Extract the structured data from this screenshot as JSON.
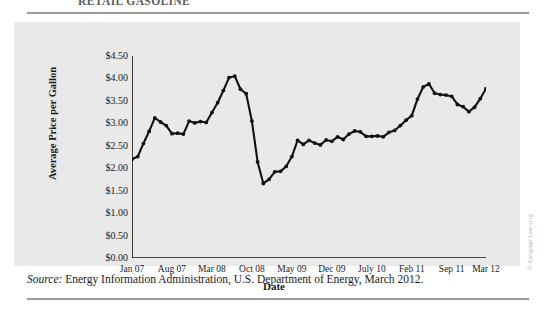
{
  "figure": {
    "running_head": "RETAIL GASOLINE",
    "credit": "© Cengage Learning"
  },
  "source": {
    "prefix": "Source:",
    "text": " Energy Information Administration, U.S. Department of Energy, March 2012."
  },
  "axes": {
    "ylabel": "Average Price per Gallon",
    "xlabel": "Date",
    "ytick_labels": [
      "$4.50",
      "$4.00",
      "$3.50",
      "$3.00",
      "$2.50",
      "$2.00",
      "$1.50",
      "$1.00",
      "$0.50",
      "$0.00"
    ],
    "xtick_labels": [
      "Jan 07",
      "Aug 07",
      "Mar 08",
      "Oct 08",
      "May 09",
      "Dec 09",
      "July 10",
      "Feb 11",
      "Sep 11",
      "Mar 12"
    ]
  },
  "chart_data": {
    "type": "line",
    "xlabel": "Date",
    "ylabel": "Average Price per Gallon",
    "ylim": [
      0.0,
      4.5
    ],
    "ytick_values": [
      0.0,
      0.5,
      1.0,
      1.5,
      2.0,
      2.5,
      3.0,
      3.5,
      4.0,
      4.5
    ],
    "ytick_labels": [
      "$0.00",
      "$0.50",
      "$1.00",
      "$1.50",
      "$2.00",
      "$2.50",
      "$3.00",
      "$3.50",
      "$4.00",
      "$4.50"
    ],
    "grid": false,
    "legend": "none",
    "markers": "filled-circle",
    "line_color": "#111111",
    "panel_color": "#e9e9e9",
    "xtick_labels": [
      "Jan 07",
      "Aug 07",
      "Mar 08",
      "Oct 08",
      "May 09",
      "Dec 09",
      "July 10",
      "Feb 11",
      "Sep 11",
      "Mar 12"
    ],
    "xtick_indices": [
      0,
      7,
      14,
      21,
      28,
      35,
      42,
      49,
      56,
      62
    ],
    "x": [
      "Jan 07",
      "Feb 07",
      "Mar 07",
      "Apr 07",
      "May 07",
      "Jun 07",
      "Jul 07",
      "Aug 07",
      "Sep 07",
      "Oct 07",
      "Nov 07",
      "Dec 07",
      "Jan 08",
      "Feb 08",
      "Mar 08",
      "Apr 08",
      "May 08",
      "Jun 08",
      "Jul 08",
      "Aug 08",
      "Sep 08",
      "Oct 08",
      "Nov 08",
      "Dec 08",
      "Jan 09",
      "Feb 09",
      "Mar 09",
      "Apr 09",
      "May 09",
      "Jun 09",
      "Jul 09",
      "Aug 09",
      "Sep 09",
      "Oct 09",
      "Nov 09",
      "Dec 09",
      "Jan 10",
      "Feb 10",
      "Mar 10",
      "Apr 10",
      "May 10",
      "Jun 10",
      "Jul 10",
      "Aug 10",
      "Sep 10",
      "Oct 10",
      "Nov 10",
      "Dec 10",
      "Jan 11",
      "Feb 11",
      "Mar 11",
      "Apr 11",
      "May 11",
      "Jun 11",
      "Jul 11",
      "Aug 11",
      "Sep 11",
      "Oct 11",
      "Nov 11",
      "Dec 11",
      "Jan 12",
      "Feb 12",
      "Mar 12"
    ],
    "values": [
      2.2,
      2.26,
      2.55,
      2.82,
      3.12,
      3.03,
      2.95,
      2.77,
      2.78,
      2.76,
      3.05,
      3.01,
      3.04,
      3.02,
      3.24,
      3.46,
      3.73,
      4.02,
      4.05,
      3.76,
      3.66,
      3.05,
      2.14,
      1.66,
      1.75,
      1.92,
      1.93,
      2.04,
      2.26,
      2.62,
      2.53,
      2.62,
      2.56,
      2.52,
      2.63,
      2.6,
      2.7,
      2.64,
      2.76,
      2.83,
      2.81,
      2.71,
      2.71,
      2.72,
      2.7,
      2.8,
      2.84,
      2.95,
      3.07,
      3.17,
      3.54,
      3.81,
      3.88,
      3.67,
      3.64,
      3.63,
      3.6,
      3.42,
      3.37,
      3.26,
      3.36,
      3.55,
      3.77
    ]
  }
}
